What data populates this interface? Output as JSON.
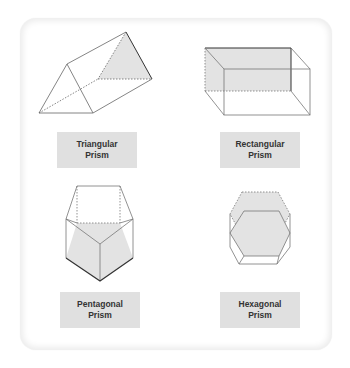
{
  "figure": {
    "colors": {
      "card_border": "#ececec",
      "label_background": "#e0e0e0",
      "label_text": "#333333",
      "shaded_face": "#e3e3e3",
      "edge": "#555555",
      "hidden_edge": "#555555"
    },
    "shapes": [
      {
        "id": "triangular",
        "label_line1": "Triangular",
        "label_line2": "Prism"
      },
      {
        "id": "rectangular",
        "label_line1": "Rectangular",
        "label_line2": "Prism"
      },
      {
        "id": "pentagonal",
        "label_line1": "Pentagonal",
        "label_line2": "Prism"
      },
      {
        "id": "hexagonal",
        "label_line1": "Hexagonal",
        "label_line2": "Prism"
      }
    ]
  }
}
